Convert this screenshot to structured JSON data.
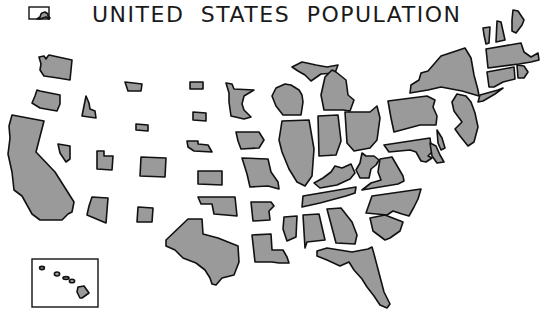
{
  "title": "UNITED STATES POPULATION",
  "map_type": "cartogram",
  "colors": {
    "state_fill": "#9a9a9a",
    "state_stroke": "#111111",
    "background": "#ffffff"
  },
  "insets": [
    {
      "name": "Alaska",
      "frame": [
        29,
        7,
        20,
        12
      ]
    },
    {
      "name": "Hawaii",
      "frame": [
        32,
        259,
        66,
        48
      ]
    }
  ],
  "states": [
    {
      "id": "WA",
      "name": "Washington",
      "points": "39,57 44,56 46,59 48,56 49,55 72,60 70,80 58,78 44,76 40,70 41,64"
    },
    {
      "id": "OR",
      "name": "Oregon",
      "points": "37,90 40,91 45,92 60,95 60,104 57,111 40,108 32,103 35,96"
    },
    {
      "id": "CA",
      "name": "California",
      "points": "12,115 44,121 36,152 55,172 74,202 72,212 68,214 62,220 40,220 32,214 22,196 14,190 12,172 8,154 10,138 9,126"
    },
    {
      "id": "ID",
      "name": "Idaho",
      "points": "86,96 89,103 90,109 95,111 96,118 82,116 84,106"
    },
    {
      "id": "NV",
      "name": "Nevada",
      "points": "58,144 70,146 70,159 66,162 60,153"
    },
    {
      "id": "UT",
      "name": "Utah",
      "points": "97,151 104,151 104,156 113,156 112,170 97,169"
    },
    {
      "id": "AZ",
      "name": "Arizona",
      "points": "92,197 108,198 106,223 87,215 89,206"
    },
    {
      "id": "NM",
      "name": "New Mexico",
      "points": "138,207 153,208 152,222 137,222"
    },
    {
      "id": "CO",
      "name": "Colorado",
      "points": "141,157 166,158 165,177 140,176"
    },
    {
      "id": "MT",
      "name": "Montana",
      "points": "125,82 142,84 141,91 128,91"
    },
    {
      "id": "WY",
      "name": "Wyoming",
      "points": "136,124 148,125 148,131 136,130"
    },
    {
      "id": "ND",
      "name": "North Dakota",
      "points": "190,82 203,82 203,89 190,89"
    },
    {
      "id": "SD",
      "name": "South Dakota",
      "points": "193,112 206,113 206,121 193,120"
    },
    {
      "id": "NE",
      "name": "Nebraska",
      "points": "187,141 198,141 198,144 208,145 212,152 194,151 188,147"
    },
    {
      "id": "KS",
      "name": "Kansas",
      "points": "198,171 222,171 222,185 198,184"
    },
    {
      "id": "OK",
      "name": "Oklahoma",
      "points": "198,197 235,197 237,216 226,215 214,214 212,204 201,204"
    },
    {
      "id": "TX",
      "name": "Texas",
      "points": "188,219 202,219 203,234 218,238 238,246 239,262 234,275 222,278 216,285 212,284 210,278 205,270 196,263 183,258 175,250 166,246 166,240"
    },
    {
      "id": "MN",
      "name": "Minnesota",
      "points": "226,83 232,84 234,89 254,90 244,96 242,104 244,110 251,117 244,119 231,116 229,102 229,93"
    },
    {
      "id": "IA",
      "name": "Iowa",
      "points": "236,132 259,132 264,140 259,148 241,149 238,141"
    },
    {
      "id": "MO",
      "name": "Missouri",
      "points": "242,158 268,159 271,172 278,182 279,189 268,186 250,187 247,174"
    },
    {
      "id": "AR",
      "name": "Arkansas",
      "points": "251,202 271,202 274,206 269,211 270,220 253,221"
    },
    {
      "id": "LA",
      "name": "Louisiana",
      "points": "252,235 271,234 272,250 283,250 287,257 289,263 279,263 272,262 255,262"
    },
    {
      "id": "WI",
      "name": "Wisconsin",
      "points": "276,88 285,84 291,85 299,90 302,95 303,102 301,115 283,115 276,106 272,96"
    },
    {
      "id": "IL",
      "name": "Illinois",
      "points": "282,121 309,120 314,149 312,176 305,186 297,182 289,169 282,152 279,140"
    },
    {
      "id": "MI",
      "name": "Michigan",
      "points": "292,67 302,62 307,63 316,65 327,67 338,65 335,73 321,74 311,81 305,75 298,71"
    },
    {
      "id": "MI-L",
      "name": "Michigan (Lower)",
      "points": "325,77 332,70 336,72 346,80 348,95 354,100 350,111 343,110 324,110 321,95"
    },
    {
      "id": "IN",
      "name": "Indiana",
      "points": "318,116 338,115 341,141 336,155 319,156"
    },
    {
      "id": "OH",
      "name": "Ohio",
      "points": "345,112 370,112 377,106 380,118 377,140 370,148 354,151 347,143"
    },
    {
      "id": "KY",
      "name": "Kentucky",
      "points": "314,183 323,178 331,172 335,166 342,168 351,164 355,173 350,179 337,185 320,188"
    },
    {
      "id": "TN",
      "name": "Tennessee",
      "points": "303,196 356,187 355,193 346,196 320,203 302,207"
    },
    {
      "id": "MS",
      "name": "Mississippi",
      "points": "284,217 297,216 296,237 287,241 283,229"
    },
    {
      "id": "AL",
      "name": "Alabama",
      "points": "303,215 319,214 325,240 307,242 305,248"
    },
    {
      "id": "GA",
      "name": "Georgia",
      "points": "327,209 341,208 352,222 357,235 355,244 336,243"
    },
    {
      "id": "FL",
      "name": "Florida",
      "points": "317,251 327,248 352,252 368,249 372,247 374,254 379,273 384,292 390,304 387,308 380,305 374,296 367,287 362,279 354,270 349,262 340,266 327,260 317,256"
    },
    {
      "id": "WV",
      "name": "West Virginia",
      "points": "362,153 366,156 374,156 379,160 376,165 371,169 369,178 360,178 356,170 360,163"
    },
    {
      "id": "VA",
      "name": "Virginia",
      "points": "380,159 392,157 403,176 404,181 398,184 362,190 371,183 381,180 378,172"
    },
    {
      "id": "NC",
      "name": "North Carolina",
      "points": "372,196 421,189 418,199 414,207 409,216 402,214 393,211 387,215 366,213"
    },
    {
      "id": "SC",
      "name": "South Carolina",
      "points": "370,218 385,215 403,222 400,231 390,238 385,240 373,231"
    },
    {
      "id": "PA",
      "name": "Pennsylvania",
      "points": "388,101 427,96 435,100 433,107 437,116 436,125 420,125 394,132 391,118"
    },
    {
      "id": "NY",
      "name": "New York",
      "points": "411,85 419,80 421,73 428,71 441,56 465,48 471,58 474,75 478,90 479,96 462,91 441,87 428,90 410,93"
    },
    {
      "id": "NJ",
      "name": "New Jersey",
      "points": "457,94 466,96 471,102 475,113 478,127 474,142 468,146 460,136 455,129 462,122 454,111 452,102"
    },
    {
      "id": "MD",
      "name": "Maryland",
      "points": "384,145 430,138 432,152 428,156 432,158 426,162 421,161 416,152 410,150 389,152"
    },
    {
      "id": "DE",
      "name": "Delaware",
      "points": "437,130 442,138 445,148 441,150 438,143"
    },
    {
      "id": "DE2",
      "name": "Chesapeake shore",
      "points": "430,143 436,146 440,155 444,162 437,163 432,156"
    },
    {
      "id": "VT",
      "name": "Vermont",
      "points": "483,28 490,27 489,43 486,44 484,35"
    },
    {
      "id": "NH",
      "name": "New Hampshire",
      "points": "497,21 501,22 505,40 496,42"
    },
    {
      "id": "ME",
      "name": "Maine",
      "points": "513,10 518,11 524,20 522,25 516,33 512,31 512,20"
    },
    {
      "id": "MA",
      "name": "Massachusetts",
      "points": "486,49 521,43 524,52 531,57 538,53 539,60 531,62 519,64 488,68"
    },
    {
      "id": "RI",
      "name": "Rhode Island",
      "points": "517,65 524,66 528,72 524,78 518,78"
    },
    {
      "id": "CT",
      "name": "Connecticut",
      "points": "487,72 514,67 515,79 503,82 494,87 489,87"
    },
    {
      "id": "LI",
      "name": "Long Island",
      "points": "480,95 498,90 503,88 495,94 483,101 478,102"
    }
  ],
  "alaska": {
    "points": "40,17 41,14 42,13 45,12 48,14 48,16 50,18 49,19 46,17 43,18 40,19 37,19"
  },
  "hawaii": {
    "islands": [
      {
        "name": "Kauai",
        "cx": 42,
        "cy": 268,
        "rx": 2.4,
        "ry": 1.6
      },
      {
        "name": "Oahu",
        "cx": 57,
        "cy": 274,
        "rx": 2.6,
        "ry": 2
      },
      {
        "name": "Molokai",
        "cx": 66,
        "cy": 278,
        "rx": 3,
        "ry": 1.4
      },
      {
        "name": "Maui",
        "cx": 72,
        "cy": 281,
        "rx": 2.6,
        "ry": 1.8
      },
      {
        "name": "Hawaii",
        "points": "78,287 84,286 89,293 82,298 80,298 77,292"
      }
    ]
  }
}
